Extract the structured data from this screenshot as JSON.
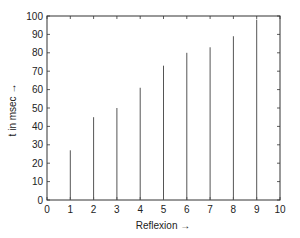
{
  "chart_data": {
    "type": "bar",
    "style": "stem",
    "title": "",
    "xlabel": "Reflexion →",
    "ylabel": "t in msec →",
    "x": [
      1,
      2,
      3,
      4,
      5,
      6,
      7,
      8,
      9
    ],
    "values": [
      27,
      45,
      50,
      61,
      73,
      80,
      83,
      89,
      98
    ],
    "xlim": [
      0,
      10
    ],
    "ylim": [
      0,
      100
    ],
    "xticks": [
      0,
      1,
      2,
      3,
      4,
      5,
      6,
      7,
      8,
      9,
      10
    ],
    "yticks": [
      0,
      10,
      20,
      30,
      40,
      50,
      60,
      70,
      80,
      90,
      100
    ],
    "grid": false,
    "legend": null,
    "colors": {
      "bars": "#555555",
      "axes": "#333333",
      "background": "#ffffff"
    }
  },
  "labels": {
    "xlabel": "Reflexion →",
    "ylabel": "t in msec →"
  }
}
